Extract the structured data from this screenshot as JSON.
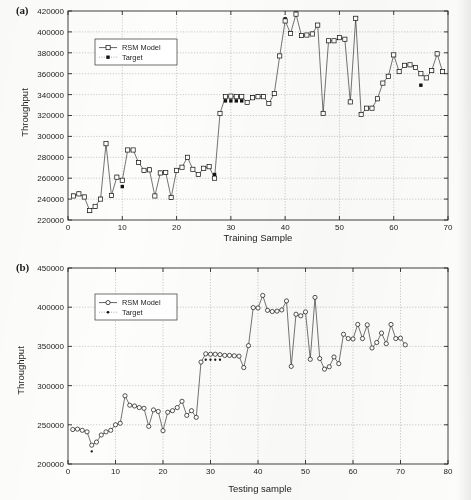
{
  "figure": {
    "panels": [
      {
        "tag": "(a)",
        "xlabel": "Training Sample",
        "ylabel": "Throughput"
      },
      {
        "tag": "(b)",
        "xlabel": "Testing sample",
        "ylabel": "Throughput"
      }
    ]
  },
  "chart_data": [
    {
      "type": "line",
      "title": "(a)",
      "xlabel": "Training Sample",
      "ylabel": "Throughput",
      "xlim": [
        0,
        70
      ],
      "ylim": [
        220000,
        420000
      ],
      "xticks": [
        0,
        10,
        20,
        30,
        40,
        50,
        60,
        70
      ],
      "yticks": [
        220000,
        240000,
        260000,
        280000,
        300000,
        320000,
        340000,
        360000,
        380000,
        400000,
        420000
      ],
      "grid": true,
      "legend_position": "upper left",
      "legend": [
        "RSM Model",
        "Target"
      ],
      "markers": {
        "RSM Model": "open-square",
        "Target": "filled-square"
      },
      "x": [
        1,
        2,
        3,
        4,
        5,
        6,
        7,
        8,
        9,
        10,
        11,
        12,
        13,
        14,
        15,
        16,
        17,
        18,
        19,
        20,
        21,
        22,
        23,
        24,
        25,
        26,
        27,
        28,
        29,
        30,
        31,
        32,
        33,
        34,
        35,
        36,
        37,
        38,
        39,
        40,
        41,
        42,
        43,
        44,
        45,
        46,
        47,
        48,
        49,
        50,
        51,
        52,
        53,
        54,
        55,
        56,
        57,
        58,
        59,
        60,
        61,
        62,
        63,
        64,
        65,
        66,
        67,
        68,
        69
      ],
      "series": [
        {
          "name": "RSM Model",
          "values": [
            243000,
            245000,
            242000,
            229000,
            233000,
            240000,
            293000,
            243500,
            261000,
            258000,
            287000,
            287000,
            275000,
            267500,
            268000,
            243000,
            265000,
            265500,
            241500,
            267500,
            270500,
            280000,
            268500,
            263500,
            269500,
            271000,
            260000,
            322000,
            338000,
            338500,
            338000,
            338000,
            332500,
            337000,
            338000,
            338000,
            331500,
            341000,
            377000,
            410500,
            398500,
            417000,
            396500,
            397000,
            398000,
            406500,
            322000,
            391500,
            391500,
            394500,
            393000,
            333000,
            413000,
            321000,
            327000,
            327000,
            336000,
            351000,
            357500,
            378000,
            362000,
            368000,
            368500,
            366000,
            360000,
            356000,
            363000,
            379000,
            362000
          ]
        },
        {
          "name": "Target",
          "values": [
            243500,
            245500,
            242500,
            228500,
            232500,
            240500,
            293000,
            243000,
            261500,
            252000,
            287000,
            287000,
            275000,
            267000,
            268500,
            243000,
            265500,
            265000,
            241000,
            267500,
            270500,
            280000,
            268500,
            263500,
            269500,
            271000,
            263500,
            322000,
            334000,
            334000,
            334000,
            334000,
            332500,
            337500,
            338500,
            338500,
            331500,
            341000,
            377000,
            412500,
            399000,
            418000,
            396500,
            397000,
            398500,
            406500,
            322000,
            391500,
            391500,
            394500,
            393000,
            333000,
            413000,
            321000,
            327000,
            327500,
            336000,
            351000,
            357500,
            378000,
            362000,
            368000,
            368500,
            366000,
            349000,
            356000,
            363000,
            379500,
            362000
          ]
        }
      ]
    },
    {
      "type": "line",
      "title": "(b)",
      "xlabel": "Testing sample",
      "ylabel": "Throughput",
      "xlim": [
        0,
        80
      ],
      "ylim": [
        200000,
        450000
      ],
      "xticks": [
        0,
        10,
        20,
        30,
        40,
        50,
        60,
        70,
        80
      ],
      "yticks": [
        200000,
        250000,
        300000,
        350000,
        400000,
        450000
      ],
      "grid": true,
      "legend_position": "upper left",
      "legend": [
        "RSM Model",
        "Target"
      ],
      "markers": {
        "RSM Model": "open-circle",
        "Target": "filled-dot"
      },
      "x": [
        1,
        2,
        3,
        4,
        5,
        6,
        7,
        8,
        9,
        10,
        11,
        12,
        13,
        14,
        15,
        16,
        17,
        18,
        19,
        20,
        21,
        22,
        23,
        24,
        25,
        26,
        27,
        28,
        29,
        30,
        31,
        32,
        33,
        34,
        35,
        36,
        37,
        38,
        39,
        40,
        41,
        42,
        43,
        44,
        45,
        46,
        47,
        48,
        49,
        50,
        51,
        52,
        53,
        54,
        55,
        56,
        57,
        58,
        59,
        60,
        61,
        62,
        63,
        64,
        65,
        66,
        67,
        68,
        69,
        70,
        71
      ],
      "series": [
        {
          "name": "RSM Model",
          "values": [
            244000,
            244500,
            243000,
            241000,
            224000,
            228000,
            237000,
            241000,
            243000,
            250000,
            252000,
            287000,
            275000,
            274000,
            272000,
            271000,
            248000,
            269000,
            267000,
            242500,
            266000,
            268000,
            272000,
            280000,
            262000,
            268000,
            259500,
            330000,
            340500,
            340000,
            340000,
            339500,
            338500,
            338500,
            338000,
            337500,
            323000,
            351000,
            399500,
            399000,
            415000,
            396000,
            394500,
            395000,
            396500,
            408000,
            324500,
            391000,
            389000,
            394000,
            333500,
            412500,
            334500,
            321000,
            324000,
            336500,
            328000,
            365500,
            360000,
            359500,
            378000,
            360000,
            377500,
            348000,
            355000,
            367000,
            353500,
            378000,
            360000,
            360500,
            352000
          ]
        },
        {
          "name": "Target",
          "values": [
            243000,
            244000,
            243000,
            240500,
            216000,
            228500,
            237500,
            241500,
            243500,
            250500,
            252500,
            287500,
            275500,
            274000,
            272500,
            271000,
            248000,
            269500,
            267500,
            242000,
            266500,
            268500,
            272500,
            280500,
            262000,
            268500,
            260000,
            330500,
            333000,
            333000,
            333000,
            333000,
            338500,
            338500,
            338000,
            337500,
            323000,
            351500,
            399500,
            399000,
            415500,
            396000,
            394500,
            395500,
            396500,
            408500,
            324500,
            391000,
            389500,
            394000,
            333500,
            413000,
            334500,
            321500,
            324500,
            337000,
            328500,
            366000,
            360500,
            360000,
            378500,
            360500,
            378000,
            348500,
            355500,
            367500,
            354000,
            378500,
            360500,
            361000,
            352500
          ]
        }
      ]
    }
  ]
}
